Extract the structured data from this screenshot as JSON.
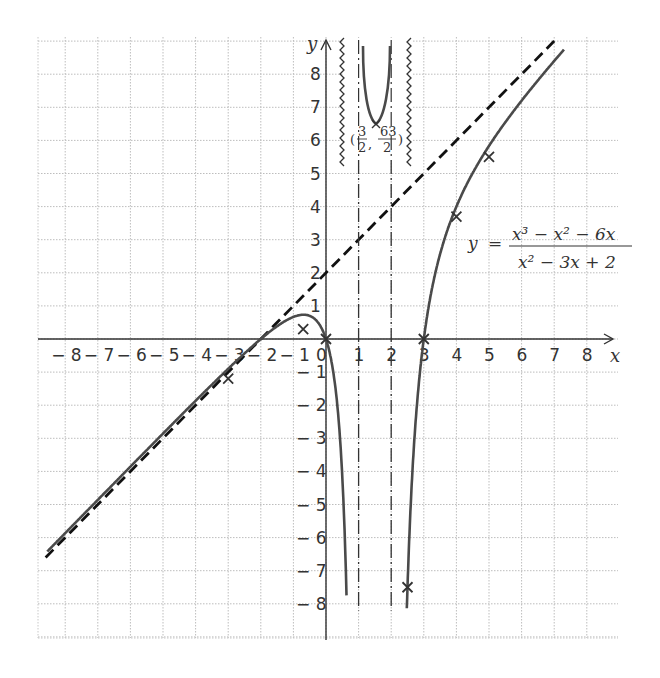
{
  "chart_data": {
    "type": "line",
    "title": "",
    "equation": {
      "lhs": "y",
      "equals": "=",
      "numerator": "x³ − x² − 6x",
      "denominator": "x² − 3x + 2"
    },
    "xlabel": "x",
    "ylabel": "y",
    "xlim": [
      -8.9,
      8.9
    ],
    "ylim": [
      -9,
      9
    ],
    "grid": true,
    "x_ticks": [
      "-8",
      "-7",
      "-6",
      "-5",
      "-4",
      "-3",
      "-2",
      "-1",
      "0",
      "1",
      "2",
      "3",
      "4",
      "5",
      "6",
      "7",
      "8"
    ],
    "y_ticks": [
      "8",
      "7",
      "6",
      "5",
      "4",
      "3",
      "2",
      "1",
      "-1",
      "-2",
      "-3",
      "-4",
      "-5",
      "-6",
      "-7",
      "-8"
    ],
    "vertical_asymptotes": [
      1,
      2
    ],
    "oblique_asymptote": {
      "label": "y = x + 2",
      "slope": 1,
      "intercept": 2
    },
    "local_min_annotation": {
      "x_num": "3",
      "x_den": "2",
      "y_num": "63",
      "y_den": "2",
      "text": "(3/2, 63/2)"
    },
    "series": [
      {
        "name": "curve",
        "style": "solid",
        "points_x": [
          -8,
          -6,
          -4,
          -3,
          -2,
          -1,
          -0.6,
          0,
          0.5,
          0.8,
          0.9
        ]
      },
      {
        "name": "oblique asymptote",
        "style": "dashed"
      },
      {
        "name": "vertical asymptotes",
        "style": "dash-dot"
      }
    ],
    "marked_points": [
      {
        "x": -3,
        "y": -1.2
      },
      {
        "x": -0.7,
        "y": 0.3
      },
      {
        "x": 0,
        "y": 0
      },
      {
        "x": 2.5,
        "y": -7.5
      },
      {
        "x": 3,
        "y": 0
      },
      {
        "x": 4,
        "y": 3.7
      },
      {
        "x": 5,
        "y": 5.5
      }
    ]
  }
}
